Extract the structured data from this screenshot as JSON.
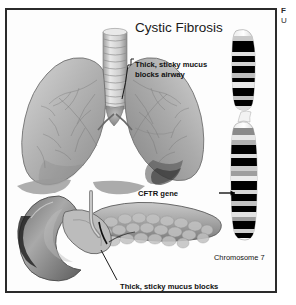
{
  "figure": {
    "title": "Cystic Fibrosis",
    "frame_color": "#2b2b2b",
    "background_color": "#ffffff"
  },
  "outside_caption": {
    "line1": "F",
    "line2": "U"
  },
  "callouts": [
    {
      "id": "airway",
      "line1": "Thick, sticky mucus",
      "line2": "blocks airway",
      "leader": "horizontal"
    },
    {
      "id": "ducts",
      "line1": "Thick, sticky mucus blocks",
      "line2": "pancreatic and bile ducts",
      "leader": "diagonal"
    }
  ],
  "gene_annotation": {
    "label": "CFTR gene",
    "arrow": "right-arrow"
  },
  "chromosome": {
    "label": "Chromosome 7",
    "arm_p_bands": 9,
    "arm_q_bands": 14,
    "band_color_dark": "#000000",
    "band_color_mid": "#8a8a8a",
    "band_color_light": "#dcdcdc"
  },
  "anatomy": {
    "lungs_label": "lungs",
    "trachea_label": "trachea",
    "pancreas_label": "pancreas",
    "duodenum_label": "duodenum"
  }
}
